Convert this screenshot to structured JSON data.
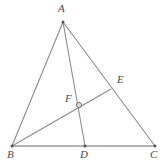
{
  "figure": {
    "background_color": "#ffffff",
    "stroke_color": "#8c8c8c",
    "base_stroke_color": "#9a9a9a",
    "label_color": "#4a4a4a",
    "width": 165,
    "height": 165
  },
  "points": {
    "A": {
      "label": "A",
      "x": 63,
      "y": 22,
      "label_x": 58,
      "label_y": 3,
      "marker": "dot"
    },
    "B": {
      "label": "B",
      "x": 12,
      "y": 146,
      "label_x": 7,
      "label_y": 149,
      "marker": "dot"
    },
    "C": {
      "label": "C",
      "x": 155,
      "y": 146,
      "label_x": 150,
      "label_y": 149,
      "marker": "dot"
    },
    "D": {
      "label": "D",
      "x": 85,
      "y": 146,
      "label_x": 80,
      "label_y": 149,
      "marker": "dot"
    },
    "E": {
      "label": "E",
      "x": 111,
      "y": 89,
      "label_x": 117,
      "label_y": 74,
      "marker": "none"
    },
    "F": {
      "label": "F",
      "x": 79,
      "y": 105,
      "label_x": 65,
      "label_y": 93,
      "marker": "ring"
    }
  },
  "segments": [
    {
      "name": "side-AB",
      "from": "A",
      "to": "B"
    },
    {
      "name": "side-AC",
      "from": "A",
      "to": "C"
    },
    {
      "name": "side-BC",
      "from": "B",
      "to": "C"
    },
    {
      "name": "cevian-AD",
      "from": "A",
      "to": "D"
    },
    {
      "name": "cevian-BE",
      "from": "B",
      "to": "E"
    }
  ]
}
